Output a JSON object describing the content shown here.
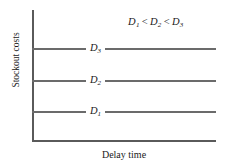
{
  "chart_data": {
    "type": "line",
    "title": "",
    "xlabel": "Delay time",
    "ylabel": "Stockout costs",
    "grid": false,
    "legend_position": "none",
    "annotation": {
      "full_text": "D1 < D2 < D3",
      "term1": "D",
      "term1_sub": "1",
      "op1": "<",
      "term2": "D",
      "term2_sub": "2",
      "op2": "<",
      "term3": "D",
      "term3_sub": "3"
    },
    "xlim": [
      0,
      1
    ],
    "ylim": [
      0,
      1
    ],
    "x": [
      0,
      1
    ],
    "series": [
      {
        "name": "D1",
        "label_base": "D",
        "label_sub": "1",
        "values": [
          0.22,
          0.22
        ],
        "color": "#6b6b6b"
      },
      {
        "name": "D2",
        "label_base": "D",
        "label_sub": "2",
        "values": [
          0.46,
          0.46
        ],
        "color": "#6b6b6b"
      },
      {
        "name": "D3",
        "label_base": "D",
        "label_sub": "3",
        "values": [
          0.7,
          0.7
        ],
        "color": "#6b6b6b"
      }
    ],
    "xticklabels": [],
    "yticklabels": [],
    "axis_color": "#5a5a5a",
    "background": "#ffffff"
  }
}
